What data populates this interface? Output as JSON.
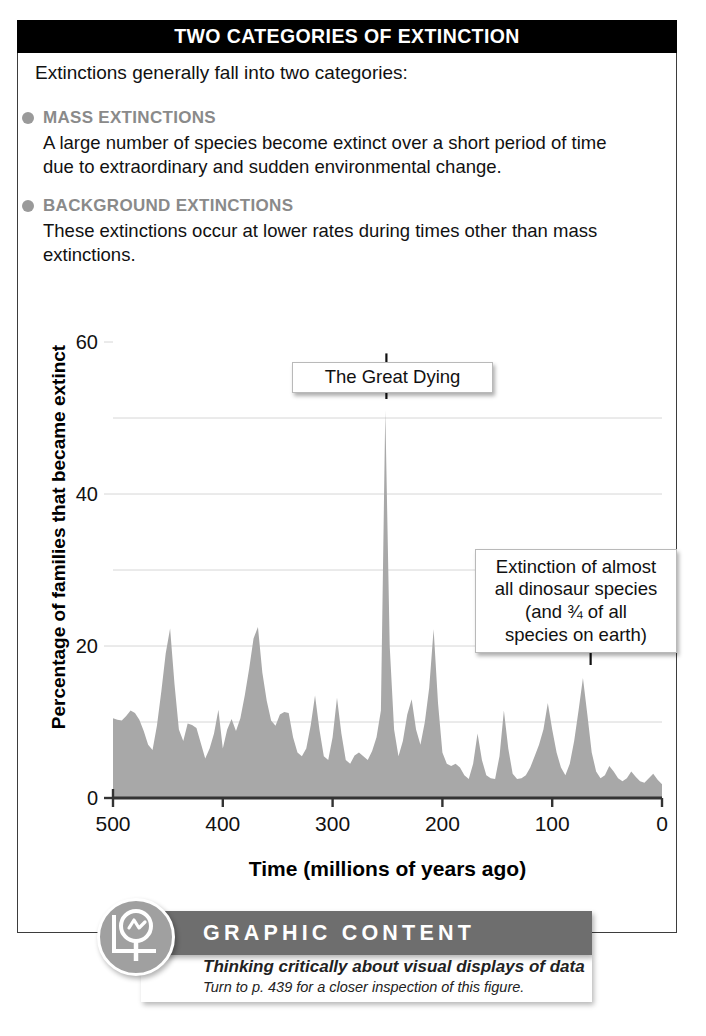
{
  "header": {
    "title": "TWO CATEGORIES OF EXTINCTION"
  },
  "intro": {
    "text": "Extinctions generally fall into two categories:"
  },
  "categories": [
    {
      "title": "MASS EXTINCTIONS",
      "body": "A large number of species become extinct over a short period of time due to extraordinary and sudden environmental change."
    },
    {
      "title": "BACKGROUND EXTINCTIONS",
      "body": "These extinctions occur at lower rates during times other than mass extinctions."
    }
  ],
  "callouts": {
    "great_dying": "The Great Dying",
    "dinosaur": [
      "Extinction of almost",
      "all dinosaur species",
      "(and ¾ of all",
      "species on earth)"
    ]
  },
  "footer": {
    "banner_title": "GRAPHIC CONTENT",
    "subtitle": "Thinking critically about visual displays of data",
    "note": "Turn to p. 439 for a closer inspection of this figure."
  },
  "colors": {
    "header_bg": "#000000",
    "category_heading": "#8a8a8a",
    "bullet": "#9a9a9a",
    "area_fill": "#a8a8a8",
    "gridline": "#d6d6d6",
    "axis": "#333333",
    "banner_bg": "#6e6e6e",
    "logo_bg": "#a0a0a0"
  },
  "chart_data": {
    "type": "area",
    "title": "",
    "xlabel": "Time  (millions of years ago)",
    "ylabel": "Percentage of families that became extinct",
    "xlim": [
      500,
      0
    ],
    "ylim": [
      0,
      60
    ],
    "x_reversed": true,
    "xticks": [
      500,
      400,
      300,
      200,
      100,
      0
    ],
    "yticks": [
      0,
      20,
      40,
      60
    ],
    "gridlines_y": [
      10,
      20,
      30,
      40,
      50
    ],
    "grid": true,
    "legend": "none",
    "annotations": [
      {
        "label": "The Great Dying",
        "x": 251,
        "y": 51
      },
      {
        "label": "Extinction of almost all dinosaur species (and ¾ of all species on earth)",
        "x": 65,
        "y": 16
      }
    ],
    "x": [
      500,
      496,
      492,
      488,
      484,
      480,
      476,
      472,
      468,
      464,
      460,
      456,
      452,
      448,
      444,
      440,
      436,
      432,
      428,
      424,
      420,
      416,
      412,
      408,
      404,
      400,
      396,
      392,
      388,
      384,
      380,
      376,
      372,
      368,
      364,
      360,
      356,
      352,
      348,
      344,
      340,
      336,
      332,
      328,
      324,
      320,
      316,
      312,
      308,
      304,
      300,
      296,
      292,
      288,
      284,
      280,
      276,
      272,
      268,
      264,
      260,
      256,
      252,
      248,
      244,
      240,
      236,
      232,
      228,
      224,
      220,
      216,
      212,
      208,
      204,
      200,
      196,
      192,
      188,
      184,
      180,
      176,
      172,
      168,
      164,
      160,
      156,
      152,
      148,
      144,
      140,
      136,
      132,
      128,
      124,
      120,
      116,
      112,
      108,
      104,
      100,
      96,
      92,
      88,
      84,
      80,
      76,
      72,
      68,
      64,
      60,
      56,
      52,
      48,
      44,
      40,
      36,
      32,
      28,
      24,
      20,
      16,
      12,
      8,
      4,
      0
    ],
    "y": [
      10.5,
      10.3,
      10.2,
      10.8,
      11.5,
      11.2,
      10.3,
      8.8,
      7.0,
      6.3,
      9.5,
      14.0,
      19.0,
      22.3,
      15.0,
      9.0,
      7.5,
      9.8,
      9.6,
      9.2,
      7.2,
      5.2,
      6.5,
      8.5,
      11.6,
      6.5,
      9.0,
      10.4,
      8.8,
      10.5,
      13.5,
      17.0,
      21.0,
      22.5,
      16.5,
      12.8,
      10.2,
      9.5,
      11.0,
      11.3,
      11.2,
      8.0,
      6.0,
      5.5,
      6.5,
      9.5,
      13.5,
      9.0,
      5.5,
      5.0,
      8.0,
      13.2,
      8.5,
      5.0,
      4.5,
      5.6,
      6.0,
      5.5,
      5.0,
      6.2,
      8.0,
      11.5,
      51.0,
      20.0,
      9.0,
      5.5,
      7.5,
      11.0,
      13.0,
      9.0,
      7.0,
      10.0,
      14.5,
      22.2,
      12.5,
      6.0,
      4.5,
      4.2,
      4.5,
      4.0,
      3.0,
      2.5,
      4.5,
      8.5,
      5.0,
      3.0,
      2.6,
      2.5,
      5.5,
      11.5,
      6.5,
      3.2,
      2.5,
      2.6,
      3.0,
      4.0,
      5.5,
      7.0,
      9.0,
      12.5,
      9.0,
      6.0,
      4.0,
      3.0,
      4.5,
      7.5,
      11.5,
      15.8,
      11.0,
      6.0,
      3.5,
      2.6,
      3.0,
      4.2,
      3.5,
      2.6,
      2.2,
      2.6,
      3.5,
      2.8,
      2.2,
      2.0,
      2.6,
      3.2,
      2.4,
      1.8,
      1.5,
      1.2
    ]
  }
}
